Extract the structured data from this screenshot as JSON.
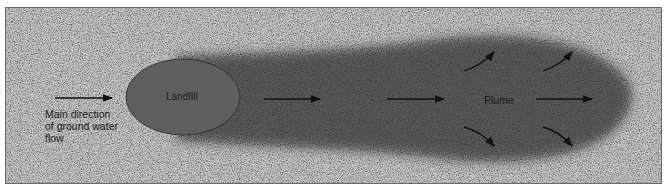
{
  "diagram": {
    "labels": {
      "flow_line1": "Main direction",
      "flow_line2": "of ground water",
      "flow_line3": "flow",
      "landfill": "Landfill",
      "plume": "Plume"
    },
    "caption": "",
    "colors": {
      "background": "#c4c4c4",
      "plume": "#585858",
      "landfill": "#5e5e5e",
      "border": "#6a6a6a",
      "arrow": "#111111"
    },
    "arrows": [
      {
        "name": "inflow-arrow",
        "direction": "right"
      },
      {
        "name": "plume-arrow-1",
        "direction": "right"
      },
      {
        "name": "plume-arrow-2",
        "direction": "right"
      },
      {
        "name": "plume-arrow-3",
        "direction": "right"
      },
      {
        "name": "spread-arrow-up-1",
        "direction": "up-right"
      },
      {
        "name": "spread-arrow-up-2",
        "direction": "up-right"
      },
      {
        "name": "spread-arrow-down-1",
        "direction": "down-right"
      },
      {
        "name": "spread-arrow-down-2",
        "direction": "down-right"
      }
    ]
  }
}
